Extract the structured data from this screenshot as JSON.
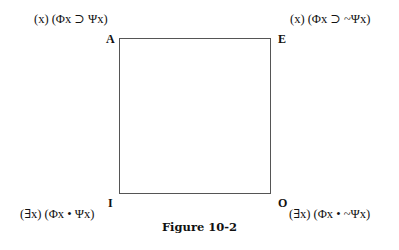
{
  "figure": {
    "caption": "Figure 10-2",
    "corners": {
      "A": {
        "label": "A",
        "formula": "(x) (Φx ⊃ Ψx)"
      },
      "E": {
        "label": "E",
        "formula": "(x) (Φx ⊃ ~Ψx)"
      },
      "I": {
        "label": "I",
        "formula": "(∃x) (Φx • Ψx)"
      },
      "O": {
        "label": "O",
        "formula": "(∃x) (Φx • ~Ψx)"
      }
    },
    "line_color": "#555555"
  }
}
